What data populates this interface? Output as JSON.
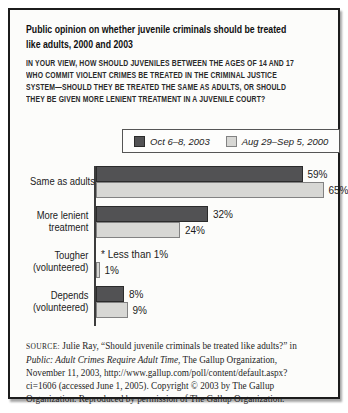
{
  "header": {
    "title_lines": [
      "Public opinion on whether juvenile criminals should be treated",
      "like adults, 2000 and 2003"
    ],
    "question_lines": [
      "IN YOUR VIEW, HOW SHOULD JUVENILES BETWEEN THE AGES OF 14 AND 17",
      "WHO COMMIT VIOLENT CRIMES BE TREATED IN THE CRIMINAL JUSTICE",
      "SYSTEM—SHOULD THEY BE TREATED THE SAME AS ADULTS, OR SHOULD",
      "THEY BE GIVEN MORE LENIENT TREATMENT IN A JUVENILE COURT?"
    ]
  },
  "chart_data": {
    "type": "bar",
    "orientation": "horizontal",
    "title": "Public opinion on whether juvenile criminals should be treated like adults, 2000 and 2003",
    "categories": [
      "Same as adults",
      "More lenient treatment",
      "Tougher (volunteered)",
      "Depends (volunteered)"
    ],
    "category_display_lines": [
      [
        "Same as adults"
      ],
      [
        "More lenient",
        "treatment"
      ],
      [
        "Tougher",
        "(volunteered)"
      ],
      [
        "Depends",
        "(volunteered)"
      ]
    ],
    "series": [
      {
        "name": "Oct 6–8, 2003",
        "color": "#525254",
        "border_color": "#2b2b2b",
        "values": [
          59,
          32,
          null,
          8
        ],
        "value_labels": [
          "59%",
          "32%",
          "* Less than 1%",
          "8%"
        ]
      },
      {
        "name": "Aug 29–Sep 5, 2000",
        "color": "#d7d7d4",
        "border_color": "#828282",
        "values": [
          65,
          24,
          1,
          9
        ],
        "value_labels": [
          "65%",
          "24%",
          "1%",
          "9%"
        ]
      }
    ],
    "footnote": "* Less than 1%",
    "layout": {
      "px_per_percent": 3.5,
      "grid": false,
      "legend_position": "top",
      "value_labels_shown": true
    }
  },
  "source": {
    "label": "SOURCE:",
    "line1_rest": " Julie Ray, “Should juvenile criminals be treated like adults?” in",
    "line2_italic": "Public: Adult Crimes Require Adult Time",
    "line2_rest": ", The Gallup Organization,",
    "line3": "November 11, 2003, http://www.gallup.com/poll/content/default.aspx?",
    "line4": "ci=1606 (accessed June 1, 2005). Copyright © 2003 by The Gallup",
    "line5": "Organization. Reproduced by permission of The Gallup Organization."
  }
}
